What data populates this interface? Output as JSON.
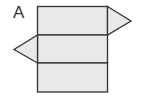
{
  "diagram": {
    "label": "A",
    "colors": {
      "fill": "#e9e9e9",
      "stroke": "#333333",
      "background": "#ffffff"
    },
    "faces": [
      {
        "type": "rectangle",
        "name": "top-face"
      },
      {
        "type": "rectangle",
        "name": "middle-face"
      },
      {
        "type": "rectangle",
        "name": "bottom-face"
      },
      {
        "type": "triangle",
        "name": "right-triangle",
        "attached_to": "top-face"
      },
      {
        "type": "triangle",
        "name": "left-triangle",
        "attached_to": "middle-face"
      }
    ]
  }
}
